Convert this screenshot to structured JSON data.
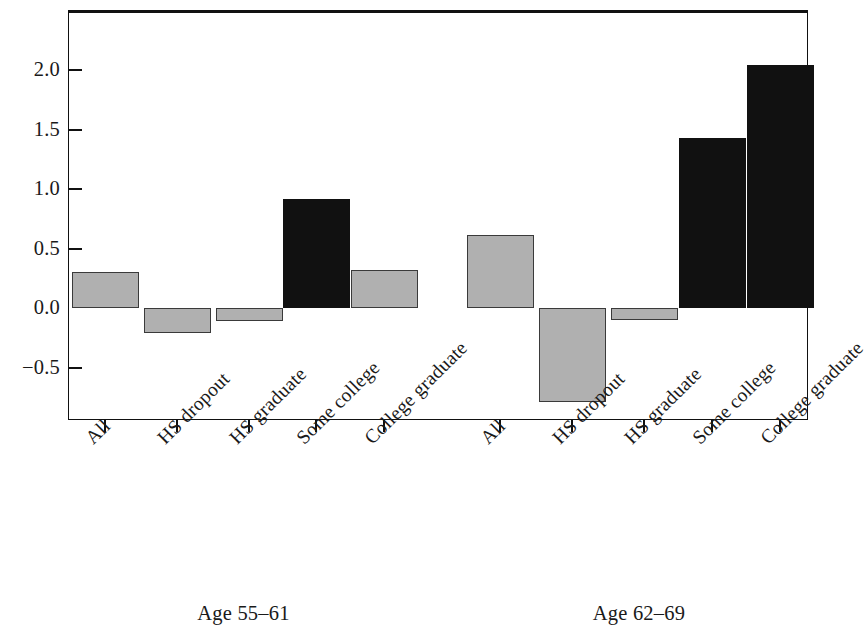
{
  "chart_data": {
    "type": "bar",
    "title": "",
    "subtitle": "",
    "xlabel": "",
    "ylabel": "",
    "ylim": [
      -1.0,
      2.35
    ],
    "grid": false,
    "legend": "none",
    "orientation": "vertical",
    "yticks": [
      {
        "value": 2.0,
        "label": "2.0"
      },
      {
        "value": 1.5,
        "label": "1.5"
      },
      {
        "value": 1.0,
        "label": "1.0"
      },
      {
        "value": 0.5,
        "label": "0.5"
      },
      {
        "value": 0.0,
        "label": "0.0"
      },
      {
        "value": -0.5,
        "label": "−0.5"
      }
    ],
    "categories": [
      "All",
      "HS dropout",
      "HS graduate",
      "Some college",
      "College graduate"
    ],
    "groups": [
      {
        "name": "Age 55–61",
        "label": "Age 55–61",
        "bars": [
          {
            "category": "All",
            "value": 0.3,
            "color": "#b0b0b0",
            "style": "gray"
          },
          {
            "category": "HS dropout",
            "value": -0.21,
            "color": "#b0b0b0",
            "style": "gray"
          },
          {
            "category": "HS graduate",
            "value": -0.11,
            "color": "#b0b0b0",
            "style": "gray"
          },
          {
            "category": "Some college",
            "value": 0.92,
            "color": "#111111",
            "style": "black"
          },
          {
            "category": "College graduate",
            "value": 0.32,
            "color": "#b0b0b0",
            "style": "gray"
          }
        ]
      },
      {
        "name": "Age 62–69",
        "label": "Age 62–69",
        "bars": [
          {
            "category": "All",
            "value": 0.61,
            "color": "#b0b0b0",
            "style": "gray"
          },
          {
            "category": "HS dropout",
            "value": -0.79,
            "color": "#b0b0b0",
            "style": "gray"
          },
          {
            "category": "HS graduate",
            "value": -0.1,
            "color": "#b0b0b0",
            "style": "gray"
          },
          {
            "category": "Some college",
            "value": 1.43,
            "color": "#111111",
            "style": "black"
          },
          {
            "category": "College graduate",
            "value": 2.04,
            "color": "#111111",
            "style": "black"
          }
        ]
      }
    ],
    "colors": {
      "gray_bar": "#b0b0b0",
      "gray_bar_edge": "#3a3a3a",
      "black_bar": "#111111",
      "axis": "#111111",
      "background": "#ffffff"
    }
  }
}
